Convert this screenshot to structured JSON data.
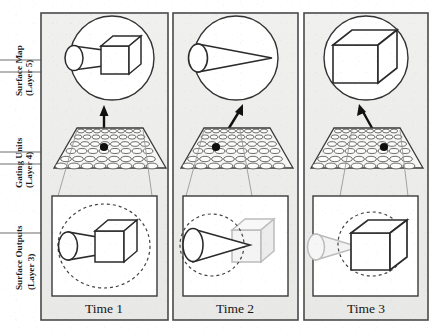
{
  "figure": {
    "title": "",
    "background_color": "#ffffff",
    "panel_fill": "#eeeeec",
    "ink_color": "#1b1b1b",
    "faded_color": "#b9b9b9"
  },
  "axis_labels": [
    {
      "id": "surface-map",
      "line1": "Surface Map",
      "line2": "(Layer 5)",
      "tick_y": [
        60,
        72
      ]
    },
    {
      "id": "gating-units",
      "line1": "Gating Units",
      "line2": "(Layer 4)",
      "tick_y": [
        152,
        164
      ]
    },
    {
      "id": "surface-outputs",
      "line1": "Surface Outputs",
      "line2": "(Layer 3)",
      "tick_y": [
        233
      ]
    }
  ],
  "panels": [
    {
      "id": "time-1",
      "time_label": "Time 1",
      "surface_map": {
        "shapes": [
          "cone",
          "cube"
        ],
        "description": "cone joined to cube"
      },
      "gating": {
        "active_dot": "center",
        "arrow": "vertical",
        "rows": 6,
        "cols": 9
      },
      "surface_output": {
        "cone_state": "solid",
        "cube_state": "solid",
        "attention_circle": "dashed",
        "attention_target": "whole-object"
      }
    },
    {
      "id": "time-2",
      "time_label": "Time 2",
      "surface_map": {
        "shapes": [
          "cone"
        ],
        "description": "cone only"
      },
      "gating": {
        "active_dot": "left",
        "arrow": "slanted-left",
        "rows": 6,
        "cols": 9
      },
      "surface_output": {
        "cone_state": "solid",
        "cube_state": "faded",
        "attention_circle": "dashed",
        "attention_target": "cone"
      }
    },
    {
      "id": "time-3",
      "time_label": "Time 3",
      "surface_map": {
        "shapes": [
          "cube"
        ],
        "description": "cube only"
      },
      "gating": {
        "active_dot": "right",
        "arrow": "slanted-right",
        "rows": 6,
        "cols": 9
      },
      "surface_output": {
        "cone_state": "faded",
        "cube_state": "solid",
        "attention_circle": "dashed",
        "attention_target": "cube"
      }
    }
  ]
}
